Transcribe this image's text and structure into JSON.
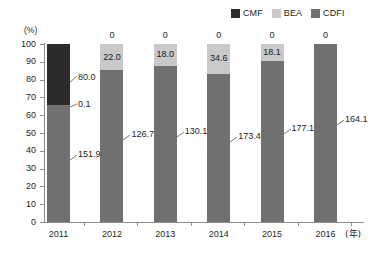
{
  "chart_data": {
    "type": "bar",
    "title": "",
    "subtitle": "",
    "stacked": true,
    "normalized": true,
    "xlabel": "(年)",
    "ylabel": "(%)",
    "ylim": [
      0,
      100
    ],
    "yticks": [
      0,
      10,
      20,
      30,
      40,
      50,
      60,
      70,
      80,
      90,
      100
    ],
    "grid": false,
    "legend_position": "top-right",
    "categories": [
      "2011",
      "2012",
      "2013",
      "2014",
      "2015",
      "2016"
    ],
    "series": [
      {
        "name": "CMF",
        "color": "#2b2b2b",
        "values": [
          80.0,
          0,
          0,
          0,
          0,
          0
        ],
        "labels": [
          "80.0",
          "0",
          "0",
          "0",
          "0",
          "0"
        ]
      },
      {
        "name": "BEA",
        "color": "#c9c9c9",
        "values": [
          0.1,
          22.0,
          18.0,
          34.6,
          18.1,
          0
        ],
        "labels": [
          "0.1",
          "22.0",
          "18.0",
          "34.6",
          "18.1",
          ""
        ]
      },
      {
        "name": "CDFI",
        "color": "#707070",
        "values": [
          151.9,
          126.7,
          130.1,
          173.4,
          177.1,
          164.1
        ],
        "labels": [
          "151.9",
          "126.7",
          "130.1",
          "173.4",
          "177.1",
          "164.1"
        ]
      }
    ],
    "totals": [
      232.0,
      148.7,
      148.1,
      208.0,
      195.2,
      164.1
    ]
  },
  "legend": {
    "items": [
      {
        "label": "CMF",
        "color": "#2b2b2b"
      },
      {
        "label": "BEA",
        "color": "#c9c9c9"
      },
      {
        "label": "CDFI",
        "color": "#707070"
      }
    ]
  },
  "axes": {
    "y_unit": "(%)",
    "x_unit": "(年)",
    "y_tick_labels": [
      "100",
      "90",
      "80",
      "70",
      "60",
      "50",
      "40",
      "30",
      "20",
      "10",
      "0"
    ],
    "x_tick_labels": [
      "2011",
      "2012",
      "2013",
      "2014",
      "2015",
      "2016"
    ]
  }
}
